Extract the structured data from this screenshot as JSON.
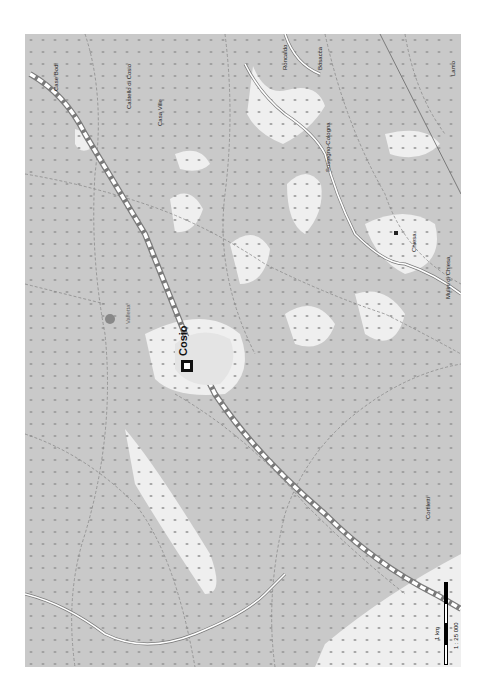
{
  "map": {
    "colors": {
      "forest": "#c9c9c9",
      "meadow": "#efefef",
      "road_fill": "#ffffff",
      "road_edge": "#7a7a7a",
      "path": "#8a8a8a",
      "dot": "#9a9a9a"
    },
    "town": {
      "name": "Cosio"
    },
    "labels": [
      {
        "text": "Case Bodi",
        "x": 28,
        "y": 57
      },
      {
        "text": "Castello di Cosio",
        "x": 101,
        "y": 75
      },
      {
        "text": "Casa Ville",
        "x": 132,
        "y": 92
      },
      {
        "text": "Roncaldo",
        "x": 257,
        "y": 36
      },
      {
        "text": "Bosacca",
        "x": 292,
        "y": 36
      },
      {
        "text": "Sostegno-Cologna",
        "x": 300,
        "y": 138
      },
      {
        "text": "Lamo",
        "x": 425,
        "y": 42
      },
      {
        "text": "Chiesa",
        "x": 411,
        "y": 218
      },
      {
        "text": "Mulini di Chiesa",
        "x": 445,
        "y": 265
      },
      {
        "text": "Cortiletti",
        "x": 425,
        "y": 485
      },
      {
        "text": "Valletta",
        "x": 125,
        "y": 290
      }
    ],
    "scale": {
      "distance_label": "1 km",
      "ratio_label": "1 : 25 000"
    }
  }
}
